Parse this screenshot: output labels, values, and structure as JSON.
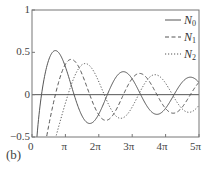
{
  "chart_data": {
    "type": "line",
    "title": "",
    "panel_label": "(b)",
    "xlabel": "",
    "ylabel": "",
    "xlim": [
      0,
      15.708
    ],
    "ylim": [
      -0.5,
      1
    ],
    "x_ticks": [
      {
        "value": 0,
        "label": "0"
      },
      {
        "value": 3.1416,
        "label": "π"
      },
      {
        "value": 6.2832,
        "label": "2π"
      },
      {
        "value": 9.4248,
        "label": "3π"
      },
      {
        "value": 12.5664,
        "label": "4π"
      },
      {
        "value": 15.708,
        "label": "5π"
      }
    ],
    "y_ticks": [
      {
        "value": 1,
        "label": "1"
      },
      {
        "value": 0.5,
        "label": "0.5"
      },
      {
        "value": 0,
        "label": "0"
      },
      {
        "value": -0.5,
        "label": "−0.5"
      }
    ],
    "zero_line": true,
    "grid": false,
    "legend_position": "upper right",
    "series": [
      {
        "name": "N0",
        "label_base": "N",
        "label_sub": "0",
        "style": "solid",
        "color": "#555555",
        "x": [
          0.5,
          1.0,
          2.0,
          2.2,
          3.0,
          3.96,
          5.0,
          5.43,
          7.0,
          7.09,
          8.6,
          10.0,
          10.2,
          11.8,
          13.36,
          14.9,
          15.7
        ],
        "values": [
          -0.44,
          0.09,
          0.51,
          0.52,
          0.38,
          0.0,
          -0.31,
          -0.34,
          0.0,
          0.0,
          0.27,
          0.06,
          0.0,
          -0.24,
          0.0,
          0.22,
          0.2
        ]
      },
      {
        "name": "N1",
        "label_base": "N",
        "label_sub": "1",
        "style": "dashed",
        "color": "#555555",
        "x": [
          1.2,
          2.2,
          3.0,
          3.68,
          5.0,
          5.43,
          6.8,
          7.0,
          8.6,
          10.0,
          11.8,
          12.0,
          13.4,
          15.0,
          15.7
        ],
        "values": [
          -0.5,
          0.0,
          0.32,
          0.42,
          0.15,
          0.0,
          -0.3,
          -0.3,
          0.0,
          0.25,
          0.04,
          -0.0,
          -0.22,
          0.07,
          0.18
        ]
      },
      {
        "name": "N2",
        "label_base": "N",
        "label_sub": "2",
        "style": "dotted",
        "color": "#555555",
        "x": [
          2.2,
          3.38,
          4.0,
          5.0,
          6.8,
          8.4,
          9.0,
          10.0,
          11.6,
          13.2,
          15.0,
          15.7
        ],
        "values": [
          -0.5,
          0.0,
          0.2,
          0.37,
          0.0,
          -0.27,
          -0.23,
          0.0,
          0.23,
          0.0,
          -0.18,
          -0.13
        ]
      }
    ]
  }
}
